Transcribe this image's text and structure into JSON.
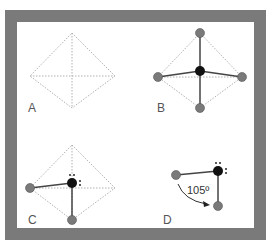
{
  "figure": {
    "colors": {
      "frame": "#7a7a7a",
      "background": "#ffffff",
      "guide": "#b0b0b0",
      "bond": "#444444",
      "central_atom": "#111111",
      "outer_atom": "#7a7a7a"
    },
    "panels": [
      {
        "id": "A",
        "label": "A",
        "description": "tetrahedron outline (dotted)"
      },
      {
        "id": "B",
        "label": "B",
        "description": "tetrahedral molecule with 4 bonded atoms"
      },
      {
        "id": "C",
        "label": "C",
        "description": "tetrahedron with 2 bonded atoms and 2 lone pairs"
      },
      {
        "id": "D",
        "label": "D",
        "description": "bent molecule with bond angle"
      }
    ],
    "bond_angle": "105º"
  }
}
